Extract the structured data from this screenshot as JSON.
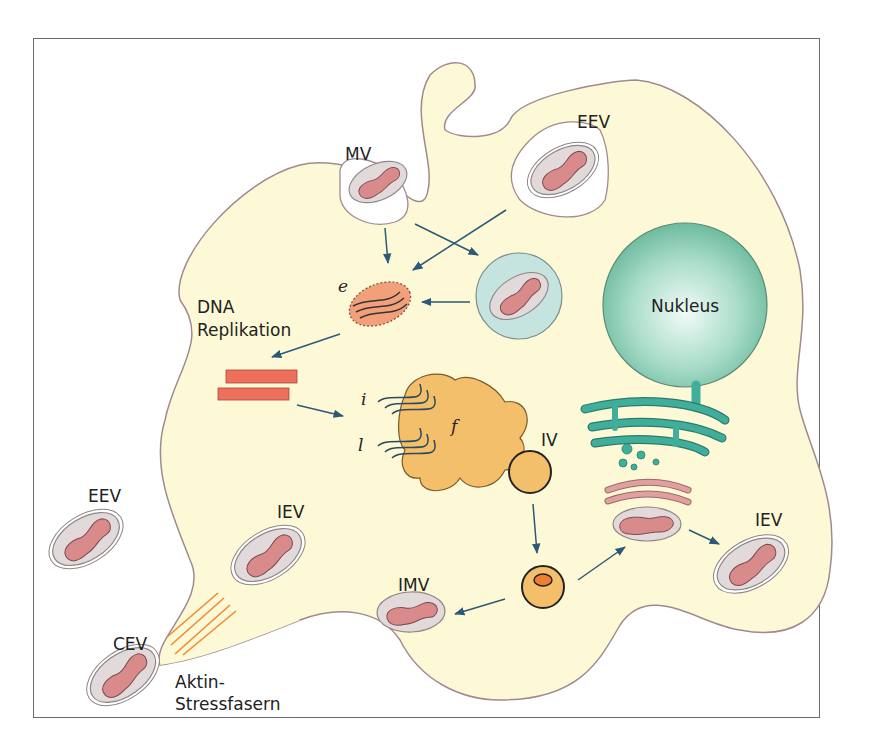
{
  "diagram": {
    "labels": {
      "mv": "MV",
      "eev_top": "EEV",
      "nucleus": "Nukleus",
      "e": "e",
      "dna_line1": "DNA",
      "dna_line2": "Replikation",
      "i": "i",
      "l": "l",
      "f": "f",
      "iv": "IV",
      "eev_left": "EEV",
      "iev_left": "IEV",
      "iev_right": "IEV",
      "imv": "IMV",
      "cev": "CEV",
      "aktin_line1": "Aktin-",
      "aktin_line2": "Stressfasern"
    },
    "colors": {
      "cytoplasm": "#fdf9d6",
      "membrane": "#a08a90",
      "virion_outer": "#e3dcdc",
      "virion_core": "#d98a8a",
      "nucleus": "#8ccfb7",
      "er": "#3fae9b",
      "factory": "#f4bf6a",
      "dna_bars": "#ee6f5c",
      "arrows": "#2b5a78",
      "actin": "#f08a30",
      "endosome": "#c5e4e0"
    }
  }
}
